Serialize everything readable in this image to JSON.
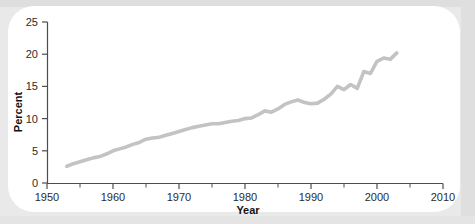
{
  "figure": {
    "background_color": "#e9e9e9",
    "card_color": "#ffffff",
    "line_color": "#c3c3c3",
    "axis_color": "#4d4d4d"
  },
  "axes": {
    "y_title": "Percent",
    "x_title": "Year",
    "y_ticks": [
      "0",
      "5",
      "10",
      "15",
      "20",
      "25"
    ],
    "x_ticks": [
      "1950",
      "1960",
      "1970",
      "1980",
      "1990",
      "2000",
      "2010"
    ]
  },
  "chart_data": {
    "type": "line",
    "title": "",
    "subtitle": "",
    "xlabel": "Year",
    "ylabel": "Percent",
    "xlim": [
      1950,
      2010
    ],
    "ylim": [
      0,
      25
    ],
    "xtick_step": 10,
    "xminor_tick_step": 5,
    "ytick_step": 5,
    "grid": false,
    "legend": false,
    "legend_position": "none",
    "annotations": [],
    "series": [
      {
        "name": "Percent",
        "color": "#c3c3c3",
        "x": [
          1953,
          1954,
          1955,
          1956,
          1957,
          1958,
          1959,
          1960,
          1961,
          1962,
          1963,
          1964,
          1965,
          1966,
          1967,
          1968,
          1969,
          1970,
          1971,
          1972,
          1973,
          1974,
          1975,
          1976,
          1977,
          1978,
          1979,
          1980,
          1981,
          1982,
          1983,
          1984,
          1985,
          1986,
          1987,
          1988,
          1989,
          1990,
          1991,
          1992,
          1993,
          1994,
          1995,
          1996,
          1997,
          1998,
          1999,
          2000,
          2001,
          2002,
          2003
        ],
        "y": [
          2.6,
          3.0,
          3.3,
          3.6,
          3.9,
          4.1,
          4.5,
          5.0,
          5.3,
          5.6,
          6.0,
          6.3,
          6.8,
          7.0,
          7.1,
          7.4,
          7.7,
          8.0,
          8.3,
          8.6,
          8.8,
          9.0,
          9.2,
          9.2,
          9.4,
          9.6,
          9.7,
          10.0,
          10.1,
          10.6,
          11.2,
          11.0,
          11.5,
          12.2,
          12.6,
          12.9,
          12.5,
          12.3,
          12.4,
          13.0,
          13.8,
          15.0,
          14.5,
          15.3,
          14.7,
          17.3,
          17.0,
          18.9,
          19.4,
          19.2,
          20.2
        ]
      }
    ]
  }
}
